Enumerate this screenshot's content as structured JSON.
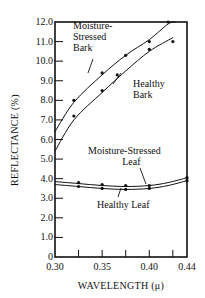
{
  "chart_data": {
    "type": "line",
    "title": "",
    "xlabel": "WAVELENGTH (μ)",
    "ylabel": "REFLECTANCE (%)",
    "xlim": [
      0.3,
      0.44
    ],
    "ylim": [
      0,
      12.0
    ],
    "x_ticks": [
      "0.30",
      "0.35",
      "0.40",
      "0.44"
    ],
    "y_ticks": [
      "0",
      "1.0",
      "2.0",
      "3.0",
      "4.0",
      "5.0",
      "6.0",
      "7.0",
      "8.0",
      "9.0",
      "10.0",
      "11.0",
      "12.0"
    ],
    "grid": false,
    "legend": "inline annotations",
    "series": [
      {
        "name": "Moisture-Stressed Bark",
        "label_lines": [
          "Moisture-",
          "Stressed",
          "Bark"
        ],
        "curve": [
          [
            0.3,
            6.4
          ],
          [
            0.32,
            7.9
          ],
          [
            0.35,
            9.3
          ],
          [
            0.375,
            10.3
          ],
          [
            0.4,
            11.1
          ],
          [
            0.42,
            11.9
          ],
          [
            0.428,
            12.0
          ]
        ],
        "points": [
          [
            0.32,
            8.0
          ],
          [
            0.35,
            9.4
          ],
          [
            0.375,
            10.3
          ],
          [
            0.4,
            11.0
          ],
          [
            0.42,
            12.0
          ]
        ]
      },
      {
        "name": "Healthy Bark",
        "label_lines": [
          "Healthy",
          "Bark"
        ],
        "curve": [
          [
            0.3,
            5.4
          ],
          [
            0.32,
            7.0
          ],
          [
            0.35,
            8.4
          ],
          [
            0.375,
            9.5
          ],
          [
            0.4,
            10.5
          ],
          [
            0.425,
            11.2
          ]
        ],
        "points": [
          [
            0.32,
            7.2
          ],
          [
            0.35,
            8.5
          ],
          [
            0.366,
            9.3
          ],
          [
            0.4,
            10.6
          ],
          [
            0.425,
            11.0
          ]
        ]
      },
      {
        "name": "Moisture-Stressed Leaf",
        "label_lines": [
          "Moisture-Stressed",
          "Leaf"
        ],
        "curve": [
          [
            0.3,
            3.85
          ],
          [
            0.325,
            3.75
          ],
          [
            0.35,
            3.65
          ],
          [
            0.375,
            3.6
          ],
          [
            0.4,
            3.65
          ],
          [
            0.42,
            3.8
          ],
          [
            0.44,
            4.05
          ]
        ],
        "points": [
          [
            0.325,
            3.8
          ],
          [
            0.35,
            3.7
          ],
          [
            0.375,
            3.65
          ],
          [
            0.4,
            3.65
          ],
          [
            0.44,
            4.05
          ]
        ]
      },
      {
        "name": "Healthy Leaf",
        "label_lines": [
          "Healthy Leaf"
        ],
        "curve": [
          [
            0.3,
            3.7
          ],
          [
            0.325,
            3.6
          ],
          [
            0.35,
            3.5
          ],
          [
            0.375,
            3.45
          ],
          [
            0.4,
            3.5
          ],
          [
            0.42,
            3.65
          ],
          [
            0.44,
            3.9
          ]
        ],
        "points": [
          [
            0.325,
            3.6
          ],
          [
            0.35,
            3.5
          ],
          [
            0.375,
            3.45
          ],
          [
            0.4,
            3.5
          ],
          [
            0.44,
            3.9
          ]
        ]
      }
    ]
  },
  "labels": {
    "ms_bark": [
      "Moisture-",
      "Stressed",
      "Bark"
    ],
    "h_bark": [
      "Healthy",
      "Bark"
    ],
    "ms_leaf": [
      "Moisture-Stressed",
      "Leaf"
    ],
    "h_leaf": "Healthy Leaf",
    "ylabel": "REFLECTANCE (%)",
    "xlabel": "WAVELENGTH (μ)"
  }
}
